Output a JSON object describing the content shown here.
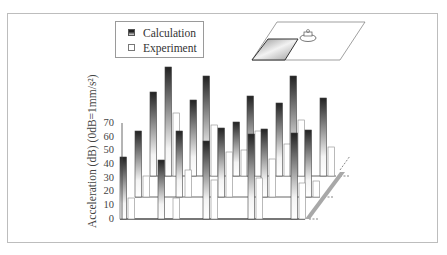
{
  "legend": {
    "items": [
      {
        "label": "Calculation",
        "swatch": "gradient-dark"
      },
      {
        "label": "Experiment",
        "swatch": "white"
      }
    ]
  },
  "axis": {
    "ylabel": "Acceleration (dB)  (0dB=1mm/s²)",
    "ticks": [
      "0",
      "10",
      "20",
      "30",
      "40",
      "50",
      "60",
      "70"
    ]
  },
  "inset": {
    "description": "plate-with-motor-schematic"
  },
  "colors": {
    "calc_top": "#2a2a2a",
    "calc_bottom": "#f2f2f2",
    "exp_fill": "#ffffff",
    "outline": "#555555",
    "floor": "#9a9a9a"
  },
  "chart_data": {
    "type": "bar",
    "subtype": "3d-grouped",
    "title": "",
    "ylabel": "Acceleration (dB) (0dB=1mm/s²)",
    "ylim": [
      0,
      70
    ],
    "legend": [
      "Calculation",
      "Experiment"
    ],
    "legend_position": "top-left",
    "grid": false,
    "rows": [
      {
        "row": "front",
        "calculation": [
          45,
          43,
          57,
          62,
          62
        ],
        "experiment": [
          15,
          15,
          28,
          30,
          25
        ]
      },
      {
        "row": "middle",
        "calculation": [
          48,
          48,
          50,
          48,
          48
        ],
        "experiment": [
          13,
          13,
          18,
          20,
          10
        ]
      },
      {
        "row": "back",
        "calculation": [
          47,
          42,
          45,
          40,
          42
        ],
        "experiment": [
          24,
          19,
          19,
          17,
          16
        ]
      }
    ],
    "bars_px": [
      {
        "x": 120,
        "base": 219,
        "top": 157,
        "kind": "calc"
      },
      {
        "x": 128,
        "base": 219,
        "top": 198,
        "kind": "exp"
      },
      {
        "x": 135,
        "base": 197,
        "top": 131,
        "kind": "calc"
      },
      {
        "x": 143,
        "base": 197,
        "top": 176,
        "kind": "exp"
      },
      {
        "x": 150,
        "base": 176,
        "top": 92,
        "kind": "calc"
      },
      {
        "x": 158,
        "base": 219,
        "top": 160,
        "kind": "calc"
      },
      {
        "x": 165,
        "base": 176,
        "top": 67,
        "kind": "calc"
      },
      {
        "x": 173,
        "base": 176,
        "top": 113,
        "kind": "exp"
      },
      {
        "x": 173,
        "base": 219,
        "top": 198,
        "kind": "exp"
      },
      {
        "x": 176,
        "base": 197,
        "top": 131,
        "kind": "calc"
      },
      {
        "x": 185,
        "base": 197,
        "top": 170,
        "kind": "exp"
      },
      {
        "x": 190,
        "base": 176,
        "top": 100,
        "kind": "calc"
      },
      {
        "x": 203,
        "base": 176,
        "top": 76,
        "kind": "calc"
      },
      {
        "x": 203,
        "base": 219,
        "top": 141,
        "kind": "calc"
      },
      {
        "x": 211,
        "base": 176,
        "top": 125,
        "kind": "exp"
      },
      {
        "x": 211,
        "base": 219,
        "top": 180,
        "kind": "exp"
      },
      {
        "x": 218,
        "base": 197,
        "top": 128,
        "kind": "calc"
      },
      {
        "x": 226,
        "base": 197,
        "top": 152,
        "kind": "exp"
      },
      {
        "x": 233,
        "base": 176,
        "top": 122,
        "kind": "calc"
      },
      {
        "x": 241,
        "base": 176,
        "top": 150,
        "kind": "exp"
      },
      {
        "x": 247,
        "base": 176,
        "top": 96,
        "kind": "calc"
      },
      {
        "x": 248,
        "base": 219,
        "top": 134,
        "kind": "calc"
      },
      {
        "x": 255,
        "base": 176,
        "top": 131,
        "kind": "exp"
      },
      {
        "x": 256,
        "base": 219,
        "top": 178,
        "kind": "exp"
      },
      {
        "x": 261,
        "base": 197,
        "top": 129,
        "kind": "calc"
      },
      {
        "x": 269,
        "base": 197,
        "top": 159,
        "kind": "exp"
      },
      {
        "x": 276,
        "base": 176,
        "top": 103,
        "kind": "calc"
      },
      {
        "x": 284,
        "base": 176,
        "top": 144,
        "kind": "exp"
      },
      {
        "x": 290,
        "base": 176,
        "top": 76,
        "kind": "calc"
      },
      {
        "x": 291,
        "base": 219,
        "top": 133,
        "kind": "calc"
      },
      {
        "x": 298,
        "base": 176,
        "top": 120,
        "kind": "exp"
      },
      {
        "x": 299,
        "base": 219,
        "top": 183,
        "kind": "exp"
      },
      {
        "x": 305,
        "base": 197,
        "top": 130,
        "kind": "calc"
      },
      {
        "x": 313,
        "base": 197,
        "top": 181,
        "kind": "exp"
      },
      {
        "x": 320,
        "base": 176,
        "top": 98,
        "kind": "calc"
      },
      {
        "x": 328,
        "base": 176,
        "top": 147,
        "kind": "exp"
      }
    ]
  }
}
